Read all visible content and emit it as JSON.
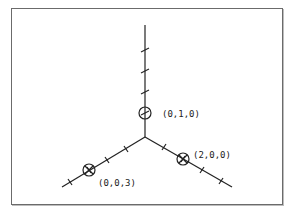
{
  "diagram": {
    "type": "3d-coordinate-axes",
    "colors": {
      "line": "#222222",
      "frame": "#6b6b6b",
      "background": "#ffffff"
    },
    "origin_px": [
      145,
      137
    ],
    "axes": [
      {
        "name": "y-axis",
        "direction": "up",
        "end_px": [
          145,
          25
        ],
        "ticks": 4
      },
      {
        "name": "x-axis",
        "direction": "lower-right",
        "end_px": [
          232,
          187
        ],
        "ticks": 4
      },
      {
        "name": "z-axis",
        "direction": "lower-left",
        "end_px": [
          62,
          187
        ],
        "ticks": 4
      }
    ],
    "points": [
      {
        "label": "(0,1,0)",
        "px": [
          145,
          113
        ],
        "label_px": [
          162,
          116
        ]
      },
      {
        "label": "(2,0,0)",
        "px": [
          183,
          159
        ],
        "label_px": [
          193,
          158
        ]
      },
      {
        "label": "(0,0,3)",
        "px": [
          89,
          170
        ],
        "label_px": [
          98,
          186
        ]
      }
    ]
  }
}
